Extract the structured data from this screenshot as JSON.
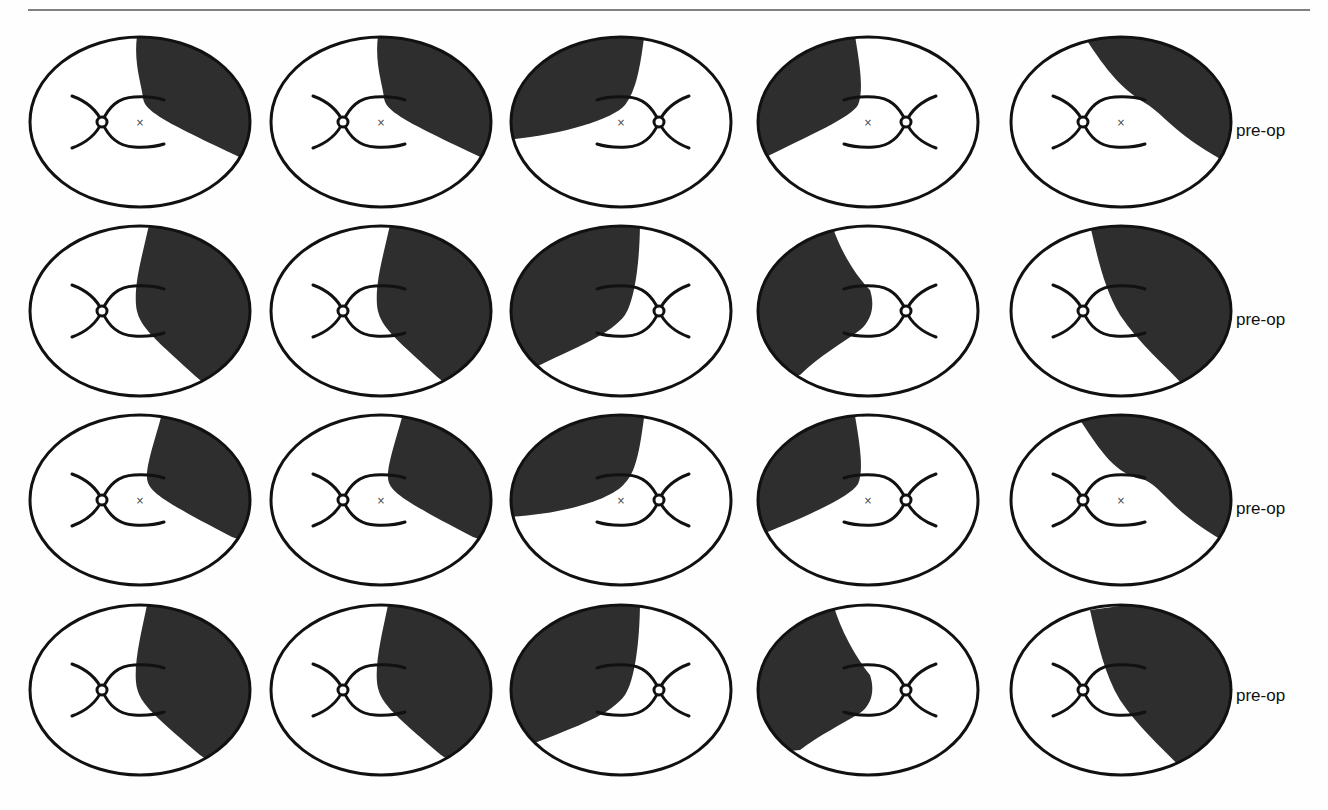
{
  "figure": {
    "rows": [
      {
        "label": "pre-op",
        "cy": 122,
        "label_y": 133,
        "cells": [
          {
            "cx": 140,
            "mirror": false,
            "center_mark": true,
            "fill": "M 138 30 C 132 60, 142 85, 143 98 C 145 112, 165 122, 250 162 L 270 170 L 270 20 Z"
          },
          {
            "cx": 381,
            "mirror": false,
            "center_mark": true,
            "fill": "M 379 30 C 373 60, 383 85, 384 98 C 386 112, 406 122, 491 162 L 511 170 L 511 20 Z"
          },
          {
            "cx": 621,
            "mirror": true,
            "center_mark": true,
            "fill": "M 645 30 C 640 70, 636 90, 625 105 C 612 120, 560 135, 505 140 L 490 140 L 490 20 Z"
          },
          {
            "cx": 868,
            "mirror": true,
            "center_mark": true,
            "fill": "M 854 30 C 860 65, 864 90, 858 105 C 850 118, 810 135, 760 160 L 745 165 L 745 20 Z"
          },
          {
            "cx": 1121,
            "mirror": false,
            "center_mark": true,
            "fill": "M 1080 30 C 1100 60, 1115 85, 1145 103 C 1165 115, 1170 130, 1222 160 L 1240 170 L 1240 20 Z"
          }
        ]
      },
      {
        "label": "pre-op",
        "cy": 311,
        "label_y": 322,
        "cells": [
          {
            "cx": 140,
            "mirror": false,
            "center_mark": false,
            "fill": "M 150 220 C 144 250, 134 280, 136 305 C 138 325, 150 335, 200 380 L 230 405 L 270 405 L 270 210 Z"
          },
          {
            "cx": 381,
            "mirror": false,
            "center_mark": false,
            "fill": "M 391 220 C 385 250, 375 280, 377 305 C 379 325, 391 335, 441 380 L 471 405 L 511 405 L 511 210 Z"
          },
          {
            "cx": 621,
            "mirror": true,
            "center_mark": false,
            "fill": "M 640 220 C 640 260, 635 300, 625 315 C 610 335, 580 345, 530 370 L 500 380 L 500 210 Z"
          },
          {
            "cx": 868,
            "mirror": true,
            "center_mark": false,
            "fill": "M 832 225 C 840 250, 855 275, 870 290 C 875 305, 872 320, 860 330 C 840 345, 820 355, 800 375 L 745 380 L 745 210 Z"
          },
          {
            "cx": 1121,
            "mirror": false,
            "center_mark": false,
            "fill": "M 1090 225 C 1098 260, 1105 290, 1120 315 C 1140 345, 1165 365, 1183 385 L 1240 400 L 1240 210 Z"
          }
        ]
      },
      {
        "label": "pre-op",
        "cy": 500,
        "label_y": 511,
        "cells": [
          {
            "cx": 140,
            "mirror": false,
            "center_mark": true,
            "fill": "M 163 410 C 155 440, 146 465, 147 478 C 148 492, 165 502, 232 537 L 270 550 L 270 400 Z"
          },
          {
            "cx": 381,
            "mirror": false,
            "center_mark": true,
            "fill": "M 404 410 C 396 440, 387 465, 388 478 C 389 492, 406 502, 473 537 L 511 550 L 511 400 Z"
          },
          {
            "cx": 621,
            "mirror": true,
            "center_mark": true,
            "fill": "M 645 410 C 640 450, 636 472, 625 483 C 612 500, 560 515, 505 517 L 490 517 L 490 400 Z"
          },
          {
            "cx": 868,
            "mirror": true,
            "center_mark": true,
            "fill": "M 854 410 C 860 445, 864 470, 858 484 C 850 497, 810 515, 760 535 L 745 540 L 745 400 Z"
          },
          {
            "cx": 1121,
            "mirror": false,
            "center_mark": true,
            "fill": "M 1080 420 C 1100 450, 1115 475, 1145 480 C 1165 490, 1170 510, 1222 540 L 1240 550 L 1240 400 Z"
          }
        ]
      },
      {
        "label": "pre-op",
        "cy": 690,
        "label_y": 698,
        "cells": [
          {
            "cx": 140,
            "mirror": false,
            "center_mark": false,
            "fill": "M 148 600 C 142 630, 134 660, 136 682 C 138 702, 150 712, 200 755 L 230 775 L 270 775 L 270 590 Z"
          },
          {
            "cx": 381,
            "mirror": false,
            "center_mark": false,
            "fill": "M 389 600 C 383 630, 375 660, 377 682 C 379 702, 391 712, 441 755 L 471 775 L 511 775 L 511 590 Z"
          },
          {
            "cx": 621,
            "mirror": true,
            "center_mark": false,
            "fill": "M 640 600 C 640 640, 635 680, 625 695 C 610 715, 580 725, 530 745 L 500 755 L 500 590 Z"
          },
          {
            "cx": 868,
            "mirror": true,
            "center_mark": false,
            "fill": "M 835 610 C 843 635, 858 660, 870 675 C 875 690, 872 705, 860 713 C 840 725, 820 735, 800 750 L 745 755 L 745 590 Z"
          },
          {
            "cx": 1121,
            "mirror": false,
            "center_mark": false,
            "fill": "M 1090 610 C 1098 645, 1105 675, 1120 700 C 1140 730, 1165 750, 1183 770 L 1240 780 L 1240 590 Z"
          }
        ]
      }
    ],
    "ellipse": {
      "rx": 110,
      "ry": 85,
      "stroke": "#111111",
      "stroke_width": 3
    },
    "colors": {
      "shade": "#2e2e2e",
      "background": "#fefefe",
      "rule": "#808080",
      "line": "#111111"
    },
    "label_x": 1236
  }
}
